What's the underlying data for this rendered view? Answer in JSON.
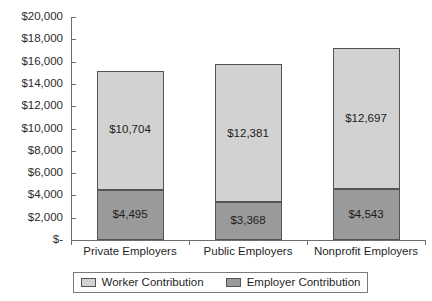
{
  "chart_data": {
    "type": "bar",
    "subtype": "stacked-bar",
    "title": "",
    "xlabel": "",
    "ylabel": "",
    "ylim": [
      0,
      20000
    ],
    "ytick_values": [
      20000,
      18000,
      16000,
      14000,
      12000,
      10000,
      8000,
      6000,
      4000,
      2000,
      0
    ],
    "ytick_labels": [
      "$20,000",
      "$18,000",
      "$16,000",
      "$14,000",
      "$12,000",
      "$10,000",
      "$8,000",
      "$6,000",
      "$4,000",
      "$2,000",
      "$-"
    ],
    "grid": false,
    "legend_position": "bottom",
    "categories": [
      "Private Employers",
      "Public Employers",
      "Nonprofit Employers"
    ],
    "series": [
      {
        "name": "Employer Contribution",
        "color": "#9a9a9a",
        "values": [
          4495,
          3368,
          4543
        ],
        "labels": [
          "$4,495",
          "$3,368",
          "$4,543"
        ]
      },
      {
        "name": "Worker Contribution",
        "color": "#d2d2d2",
        "values": [
          10704,
          12381,
          12697
        ],
        "labels": [
          "$10,704",
          "$12,381",
          "$12,697"
        ]
      }
    ],
    "stack_order": [
      "Employer Contribution",
      "Worker Contribution"
    ],
    "totals": [
      15199,
      15749,
      17240
    ]
  },
  "legend": {
    "items": [
      {
        "label": "Worker Contribution",
        "swatch": "worker"
      },
      {
        "label": "Employer Contribution",
        "swatch": "employer"
      }
    ]
  },
  "title_sliver": ""
}
